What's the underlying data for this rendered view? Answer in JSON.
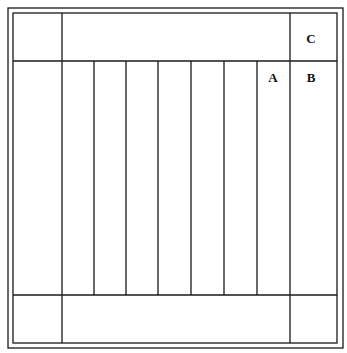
{
  "diagram": {
    "type": "grid-layout",
    "stroke_color": "#1a1a1a",
    "outer_frame": {
      "x1": 8,
      "y1": 8,
      "x2": 343,
      "y2": 348
    },
    "inner_frame": {
      "x1": 13,
      "y1": 13,
      "x2": 337,
      "y2": 343
    },
    "top_band_y": 61,
    "bottom_band_y": 295,
    "left_column_x": 62,
    "right_column_x": 290,
    "strip_lines_x": [
      94,
      126,
      158,
      191,
      224,
      257
    ],
    "labels": [
      {
        "id": "C",
        "text": "C",
        "x": 311,
        "y": 43
      },
      {
        "id": "A",
        "text": "A",
        "x": 273,
        "y": 82
      },
      {
        "id": "B",
        "text": "B",
        "x": 311,
        "y": 82
      }
    ]
  }
}
